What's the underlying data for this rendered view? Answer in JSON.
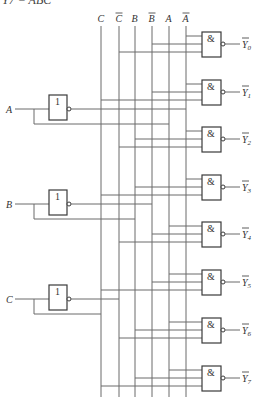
{
  "title": "Y7 = ABC",
  "colors": {
    "wire": "#6a6a6a",
    "gate_border": "#3a3a3a",
    "text": "#333333",
    "background": "#ffffff"
  },
  "inputs": [
    {
      "label": "A",
      "y": 109,
      "box_top": 95
    },
    {
      "label": "B",
      "y": 204,
      "box_top": 190
    },
    {
      "label": "C",
      "y": 299,
      "box_top": 285
    }
  ],
  "inverter_symbol": "1",
  "and_symbol": "&",
  "buses": [
    {
      "label": "C",
      "bar": false,
      "x": 101
    },
    {
      "label": "C",
      "bar": true,
      "x": 119
    },
    {
      "label": "B",
      "bar": false,
      "x": 135
    },
    {
      "label": "B",
      "bar": true,
      "x": 152
    },
    {
      "label": "A",
      "bar": false,
      "x": 169
    },
    {
      "label": "A",
      "bar": true,
      "x": 186
    }
  ],
  "gates": [
    {
      "output": "Y",
      "index": "0",
      "top": 32,
      "inputs": [
        "A'",
        "B'",
        "C'"
      ]
    },
    {
      "output": "Y",
      "index": "1",
      "top": 80,
      "inputs": [
        "A'",
        "B'",
        "C"
      ]
    },
    {
      "output": "Y",
      "index": "2",
      "top": 127,
      "inputs": [
        "A'",
        "B",
        "C'"
      ]
    },
    {
      "output": "Y",
      "index": "3",
      "top": 175,
      "inputs": [
        "A'",
        "B",
        "C"
      ]
    },
    {
      "output": "Y",
      "index": "4",
      "top": 222,
      "inputs": [
        "A",
        "B'",
        "C'"
      ]
    },
    {
      "output": "Y",
      "index": "5",
      "top": 270,
      "inputs": [
        "A",
        "B'",
        "C"
      ]
    },
    {
      "output": "Y",
      "index": "6",
      "top": 318,
      "inputs": [
        "A",
        "B",
        "C'"
      ]
    },
    {
      "output": "Y",
      "index": "7",
      "top": 366,
      "inputs": [
        "A",
        "B",
        "C"
      ]
    }
  ]
}
